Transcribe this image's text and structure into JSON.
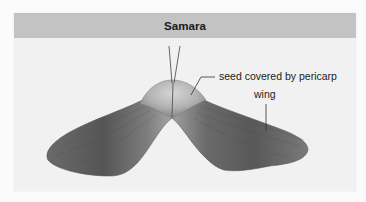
{
  "figure": {
    "title": "Samara",
    "labels": {
      "seed": "seed covered by pericarp",
      "wing": "wing"
    },
    "colors": {
      "header_bg": "#c3c3c3",
      "panel_bg": "#f1f1f1",
      "wing_dark": "#5e5e5e",
      "wing_light": "#8a8a8a",
      "seed": "#b8b8b8",
      "leader_line": "#333333"
    }
  }
}
